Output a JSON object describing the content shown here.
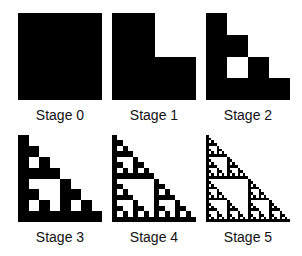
{
  "figure": {
    "fill_color": "#000000",
    "background_color": "#ffffff",
    "stages": [
      {
        "label": "Stage 0",
        "level": 0
      },
      {
        "label": "Stage 1",
        "level": 1
      },
      {
        "label": "Stage 2",
        "level": 2
      },
      {
        "label": "Stage 3",
        "level": 3
      },
      {
        "label": "Stage 4",
        "level": 4
      },
      {
        "label": "Stage 5",
        "level": 5
      }
    ]
  }
}
